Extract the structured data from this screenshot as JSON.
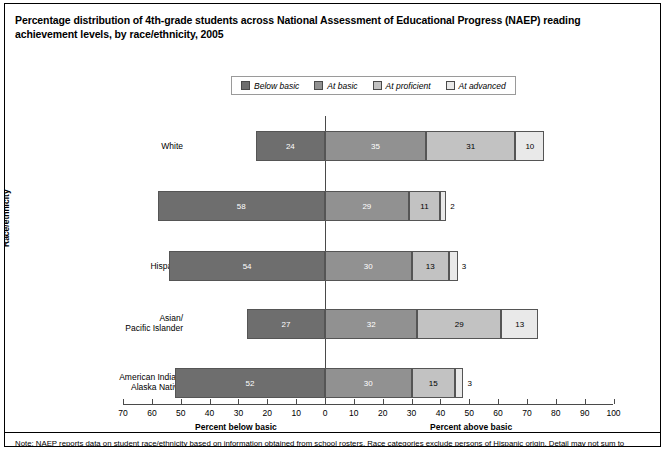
{
  "figure": {
    "title": "Percentage distribution of 4th-grade students across National Assessment of Educational Progress (NAEP) reading achievement levels, by race/ethnicity, 2005",
    "note": "Note: NAEP reports data on student race/ethnicity based on information obtained from school rosters. Race categories exclude persons of Hispanic origin. Detail may not sum to"
  },
  "chart_data": {
    "type": "bar",
    "orientation": "horizontal-diverging-stacked",
    "title": "Percentage distribution of 4th-grade students across National Assessment of Educational Progress (NAEP) reading achievement levels, by race/ethnicity, 2005",
    "xlabel": "",
    "ylabel": "Race/ethnicity",
    "xlim": [
      -70,
      100
    ],
    "xtick_labels": [
      "70",
      "60",
      "50",
      "40",
      "30",
      "20",
      "10",
      "0",
      "10",
      "20",
      "30",
      "40",
      "50",
      "60",
      "70",
      "80",
      "90",
      "100"
    ],
    "xtick_values": [
      -70,
      -60,
      -50,
      -40,
      -30,
      -20,
      -10,
      0,
      10,
      20,
      30,
      40,
      50,
      60,
      70,
      80,
      90,
      100
    ],
    "axis_sublabel_left": "Percent below basic",
    "axis_sublabel_right": "Percent above basic",
    "grid": false,
    "legend_position": "top-center",
    "categories": [
      "White",
      "Black",
      "Hispanic",
      "Asian/\nPacific Islander",
      "American Indian/\nAlaska Native"
    ],
    "series": [
      {
        "name": "Below basic",
        "color": "#6e6e6e",
        "side": "left",
        "values": [
          24,
          58,
          54,
          27,
          52
        ]
      },
      {
        "name": "At basic",
        "color": "#919191",
        "side": "right",
        "values": [
          35,
          29,
          30,
          32,
          30
        ]
      },
      {
        "name": "At proficient",
        "color": "#c2c2c2",
        "side": "right",
        "values": [
          31,
          11,
          13,
          29,
          15
        ]
      },
      {
        "name": "At advanced",
        "color": "#e9e9e9",
        "side": "right",
        "values": [
          10,
          2,
          3,
          13,
          3
        ]
      }
    ]
  },
  "legend": {
    "items": [
      {
        "label": "Below basic",
        "color": "#6e6e6e"
      },
      {
        "label": "At basic",
        "color": "#919191"
      },
      {
        "label": "At proficient",
        "color": "#c2c2c2"
      },
      {
        "label": "At advanced",
        "color": "#e9e9e9"
      }
    ]
  },
  "axis": {
    "y_title": "Race/ethnicity",
    "left_sublabel": "Percent below basic",
    "right_sublabel": "Percent above basic"
  }
}
